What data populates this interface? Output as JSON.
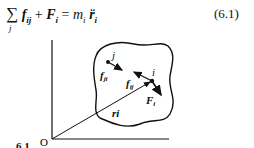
{
  "equation": {
    "sum_symbol": "∑",
    "sum_index": "j",
    "lhs_term1": "f",
    "lhs_term1_sub": "ij",
    "plus": "+",
    "lhs_term2": "F",
    "lhs_term2_sub": "i",
    "equals": "=",
    "rhs_mass": "m",
    "rhs_mass_sub": "i",
    "rhs_accel": "r̈",
    "rhs_accel_sub": "i",
    "number": "(6.1)"
  },
  "diagram": {
    "origin_label": "O",
    "particle_j_label": "j",
    "particle_i_label": "i",
    "force_ji_label": "f",
    "force_ji_sub": "ji",
    "force_ij_label": "f",
    "force_ij_sub": "ij",
    "external_force_label": "F",
    "external_force_sub": "i",
    "position_vector_label": "ri"
  },
  "clipped_text": "6.1"
}
